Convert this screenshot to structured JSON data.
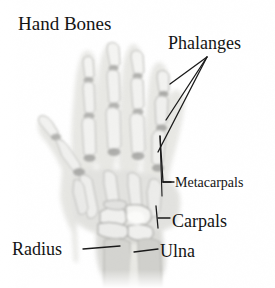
{
  "figure": {
    "title": "Hand Bones",
    "width": 275,
    "height": 288,
    "background_color": "#ffffff",
    "text_color": "#141414",
    "leader_line_color": "#1a1a1a",
    "image_type": "grayscale anatomical x-ray illustration"
  },
  "labels": {
    "title": "Hand Bones",
    "phalanges": "Phalanges",
    "metacarpals": "Metacarpals",
    "carpals": "Carpals",
    "radius": "Radius",
    "ulna": "Ulna"
  },
  "annotations": [
    {
      "name": "phalanges",
      "text": "Phalanges",
      "pointer_style": "three-fan-lines",
      "targets": [
        "distal phalanx",
        "middle phalanx",
        "proximal phalanx"
      ]
    },
    {
      "name": "metacarpals",
      "text": "Metacarpals",
      "pointer_style": "bracket-with-dash",
      "targets": [
        "metacarpal bones"
      ]
    },
    {
      "name": "carpals",
      "text": "Carpals",
      "pointer_style": "bracket-with-dash",
      "targets": [
        "carpal bones"
      ]
    },
    {
      "name": "radius",
      "text": "Radius",
      "pointer_style": "horizontal-dash",
      "targets": [
        "radius bone"
      ]
    },
    {
      "name": "ulna",
      "text": "Ulna",
      "pointer_style": "horizontal-dash",
      "targets": [
        "ulna bone"
      ]
    }
  ],
  "xray_palette": {
    "bone_light": "#f2f2f0",
    "bone_mid": "#cfcfcc",
    "soft_tissue": "#dcdcd8",
    "shadow": "#a8a8a4",
    "dark_joint": "#808080"
  }
}
